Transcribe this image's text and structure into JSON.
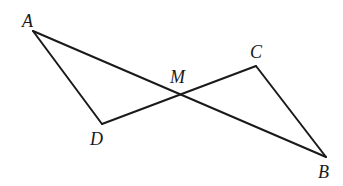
{
  "diagram": {
    "type": "geometry",
    "points": {
      "A": {
        "x": 33,
        "y": 31,
        "label": "A",
        "lx": 22,
        "ly": 27
      },
      "B": {
        "x": 326,
        "y": 157,
        "label": "B",
        "lx": 318,
        "ly": 178
      },
      "C": {
        "x": 256,
        "y": 66,
        "label": "C",
        "lx": 250,
        "ly": 58
      },
      "D": {
        "x": 102,
        "y": 124,
        "label": "D",
        "lx": 90,
        "ly": 145
      },
      "M": {
        "x": 179,
        "y": 95,
        "label": "M",
        "lx": 170,
        "ly": 83
      }
    },
    "segments": [
      {
        "from": "A",
        "to": "B"
      },
      {
        "from": "A",
        "to": "D"
      },
      {
        "from": "D",
        "to": "C"
      },
      {
        "from": "C",
        "to": "B"
      }
    ],
    "stroke_color": "#1a1a1a",
    "background": "#ffffff"
  }
}
